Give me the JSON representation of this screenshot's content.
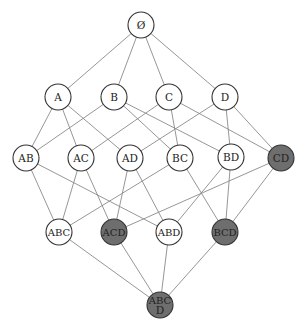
{
  "diagram": {
    "title": "",
    "type": "subset-lattice",
    "colors": {
      "plain_fill": "#ffffff",
      "highlight_fill": "#6e6e6e",
      "stroke": "#333333",
      "edge": "#8a8a8a"
    },
    "nodes": [
      {
        "id": "empty",
        "label": "Ø",
        "x": 141,
        "y": 25,
        "highlighted": false
      },
      {
        "id": "A",
        "label": "A",
        "x": 58,
        "y": 97,
        "highlighted": false
      },
      {
        "id": "B",
        "label": "B",
        "x": 114,
        "y": 97,
        "highlighted": false
      },
      {
        "id": "C",
        "label": "C",
        "x": 169,
        "y": 97,
        "highlighted": false
      },
      {
        "id": "D",
        "label": "D",
        "x": 225,
        "y": 97,
        "highlighted": false
      },
      {
        "id": "AB",
        "label": "AB",
        "x": 26,
        "y": 158,
        "highlighted": false
      },
      {
        "id": "AC",
        "label": "AC",
        "x": 81,
        "y": 158,
        "highlighted": false
      },
      {
        "id": "AD",
        "label": "AD",
        "x": 130,
        "y": 158,
        "highlighted": false
      },
      {
        "id": "BC",
        "label": "BC",
        "x": 180,
        "y": 158,
        "highlighted": false
      },
      {
        "id": "BD",
        "label": "BD",
        "x": 231,
        "y": 157,
        "highlighted": false
      },
      {
        "id": "CD",
        "label": "CD",
        "x": 281,
        "y": 158,
        "highlighted": true
      },
      {
        "id": "ABC",
        "label": "ABC",
        "x": 59,
        "y": 232,
        "highlighted": false
      },
      {
        "id": "ACD",
        "label": "ACD",
        "x": 114,
        "y": 232,
        "highlighted": true
      },
      {
        "id": "ABD",
        "label": "ABD",
        "x": 169,
        "y": 232,
        "highlighted": false
      },
      {
        "id": "BCD",
        "label": "BCD",
        "x": 225,
        "y": 232,
        "highlighted": true
      },
      {
        "id": "ABCD",
        "label": "ABC D",
        "label_lines": [
          "ABC",
          "D"
        ],
        "x": 160,
        "y": 305,
        "highlighted": true
      }
    ],
    "edges": [
      [
        "empty",
        "A"
      ],
      [
        "empty",
        "B"
      ],
      [
        "empty",
        "C"
      ],
      [
        "empty",
        "D"
      ],
      [
        "A",
        "AB"
      ],
      [
        "A",
        "AC"
      ],
      [
        "A",
        "AD"
      ],
      [
        "B",
        "AB"
      ],
      [
        "B",
        "BC"
      ],
      [
        "B",
        "BD"
      ],
      [
        "C",
        "AC"
      ],
      [
        "C",
        "BC"
      ],
      [
        "C",
        "CD"
      ],
      [
        "D",
        "AD"
      ],
      [
        "D",
        "BD"
      ],
      [
        "D",
        "CD"
      ],
      [
        "AB",
        "ABC"
      ],
      [
        "AB",
        "ABD"
      ],
      [
        "AC",
        "ABC"
      ],
      [
        "AC",
        "ACD"
      ],
      [
        "AD",
        "ACD"
      ],
      [
        "AD",
        "ABD"
      ],
      [
        "BC",
        "ABC"
      ],
      [
        "BC",
        "BCD"
      ],
      [
        "BD",
        "ABD"
      ],
      [
        "BD",
        "BCD"
      ],
      [
        "CD",
        "ACD"
      ],
      [
        "CD",
        "BCD"
      ],
      [
        "ABC",
        "ABCD"
      ],
      [
        "ACD",
        "ABCD"
      ],
      [
        "ABD",
        "ABCD"
      ],
      [
        "BCD",
        "ABCD"
      ]
    ],
    "node_radius": 13
  }
}
